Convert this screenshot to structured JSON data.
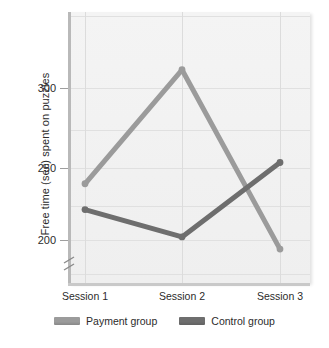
{
  "chart_data": {
    "type": "line",
    "title": "",
    "xlabel": "",
    "ylabel": "Free time (sec) spent on puzzles",
    "categories": [
      "Session 1",
      "Session 2",
      "Session 3"
    ],
    "series": [
      {
        "name": "Payment group",
        "values": [
          237,
          312,
          194
        ],
        "color": "#9b9b9b"
      },
      {
        "name": "Control group",
        "values": [
          220,
          202,
          251
        ],
        "color": "#6e6e6e"
      }
    ],
    "ylim": [
      185,
      330
    ],
    "yticks": [
      200,
      250,
      300
    ],
    "ytick_labels": [
      "200",
      "250",
      "300"
    ],
    "axis_break": true,
    "grid": true,
    "legend_position": "bottom",
    "plot_background": "#f2f2f2",
    "gridline_color": "#e0e0e0"
  },
  "axis": {
    "y_title": "Free time (sec) spent on puzzles",
    "ytick_0": "200",
    "ytick_1": "250",
    "ytick_2": "300",
    "xtick_0": "Session 1",
    "xtick_1": "Session 2",
    "xtick_2": "Session 3"
  },
  "legend": {
    "entries": [
      {
        "label": "Payment group",
        "color": "#9b9b9b"
      },
      {
        "label": "Control group",
        "color": "#6e6e6e"
      }
    ]
  }
}
